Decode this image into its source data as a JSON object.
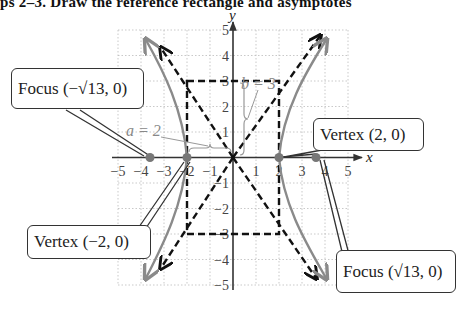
{
  "header": {
    "text": "ps 2–3. Draw the reference rectangle and asymptotes"
  },
  "graph": {
    "x_axis_label": "x",
    "y_axis_label": "y",
    "x_ticks": [
      "−5",
      "−4",
      "−3",
      "−2",
      "−1",
      "1",
      "2",
      "3",
      "4",
      "5"
    ],
    "y_ticks": [
      "5",
      "4",
      "3",
      "2",
      "1",
      "−1",
      "−2",
      "−3",
      "−4",
      "−5"
    ],
    "a_label": "a = 2",
    "b_label": "b = 3",
    "colors": {
      "hyperbola": "#8a8a8a",
      "asymptote": "#111111",
      "grid": "#bbbbbb",
      "point": "#777777"
    }
  },
  "callouts": {
    "focus_left": {
      "label": "Focus",
      "coord": "(−√13, 0)"
    },
    "focus_right": {
      "label": "Focus",
      "coord": "(√13, 0)"
    },
    "vertex_left": {
      "label": "Vertex",
      "coord": "(−2, 0)"
    },
    "vertex_right": {
      "label": "Vertex",
      "coord": "(2, 0)"
    }
  }
}
